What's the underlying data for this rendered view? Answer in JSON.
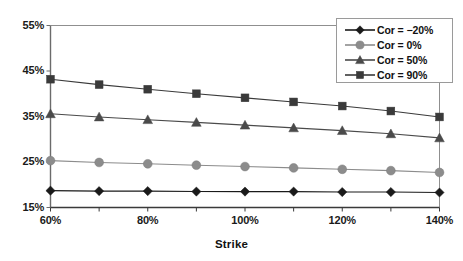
{
  "chart_data": {
    "type": "line",
    "title": "",
    "xlabel": "Strike",
    "ylabel": "",
    "x": [
      60,
      70,
      80,
      90,
      100,
      110,
      120,
      130,
      140
    ],
    "xtick_labels": [
      "60%",
      "80%",
      "100%",
      "120%",
      "140%"
    ],
    "xtick_values": [
      60,
      80,
      100,
      120,
      140
    ],
    "xlim": [
      60,
      140
    ],
    "ytick_labels": [
      "15%",
      "25%",
      "35%",
      "45%",
      "55%"
    ],
    "ytick_values": [
      15,
      25,
      35,
      45,
      55
    ],
    "ylim": [
      15,
      55
    ],
    "grid": false,
    "legend_position": "top-right",
    "series": [
      {
        "name": "Cor = −20%",
        "marker": "diamond",
        "color": "#1a1a1a",
        "values": [
          18.7,
          18.6,
          18.6,
          18.5,
          18.5,
          18.5,
          18.4,
          18.4,
          18.3
        ]
      },
      {
        "name": "Cor = 0%",
        "marker": "circle",
        "color": "#8c8c8c",
        "values": [
          25.3,
          24.9,
          24.6,
          24.3,
          24.0,
          23.7,
          23.4,
          23.1,
          22.7
        ]
      },
      {
        "name": "Cor = 50%",
        "marker": "triangle",
        "color": "#4a4a4a",
        "values": [
          35.6,
          34.9,
          34.3,
          33.7,
          33.1,
          32.5,
          31.9,
          31.2,
          30.3
        ]
      },
      {
        "name": "Cor = 90%",
        "marker": "square",
        "color": "#3a3a3a",
        "values": [
          43.2,
          42.0,
          41.0,
          40.0,
          39.1,
          38.2,
          37.3,
          36.2,
          34.9
        ]
      }
    ]
  },
  "axis": {
    "x_title": "Strike"
  },
  "legend": {
    "entries": [
      {
        "label": "Cor = −20%"
      },
      {
        "label": "Cor = 0%"
      },
      {
        "label": "Cor = 50%"
      },
      {
        "label": "Cor = 90%"
      }
    ]
  }
}
